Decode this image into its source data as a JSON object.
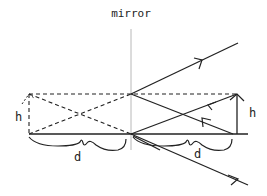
{
  "title": "mirror",
  "labels": {
    "mirror": "mirror",
    "height_left": "h",
    "distance_left": "d",
    "height_right": "h",
    "distance_right": "d"
  },
  "geometry": {
    "mirror_x": 131,
    "top_y": 94,
    "base_y": 134,
    "left_x": 29,
    "right_x": 237
  },
  "colors": {
    "line": "#222222",
    "mirror": "#b8b8b8",
    "background": "#ffffff"
  }
}
